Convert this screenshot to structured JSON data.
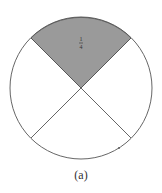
{
  "diagram": {
    "type": "fraction-circle",
    "sections": 4,
    "shaded_sections": 1,
    "shaded_label": "1/4",
    "label_numerator": "1",
    "label_denominator": "4",
    "caption": "(a)",
    "colors": {
      "shade": "#9a9a9a",
      "stroke": "#555555",
      "background": "#ffffff"
    }
  }
}
